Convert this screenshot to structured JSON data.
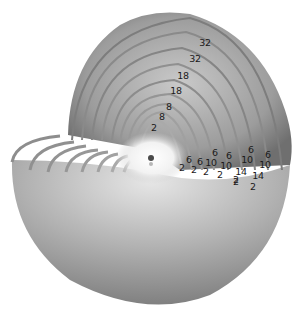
{
  "diagram": {
    "type": "atomic-electron-shell-cutaway",
    "colors": {
      "background": "#ffffff",
      "shell_dark": "#6e6e6e",
      "shell_mid": "#9a9a9a",
      "shell_light": "#d8d8d8",
      "core_glow": "#ffffff",
      "nucleus": "#4a4a4a",
      "label": "#1a1a1a"
    },
    "shell_capacity_labels": [
      {
        "text": "2",
        "x": 154,
        "y": 128
      },
      {
        "text": "8",
        "x": 162,
        "y": 117
      },
      {
        "text": "8",
        "x": 169,
        "y": 107
      },
      {
        "text": "18",
        "x": 176,
        "y": 91
      },
      {
        "text": "18",
        "x": 183,
        "y": 76
      },
      {
        "text": "32",
        "x": 195,
        "y": 59
      },
      {
        "text": "32",
        "x": 205,
        "y": 43
      }
    ],
    "subshell_columns": [
      {
        "labels": [
          {
            "text": "2",
            "x": 182,
            "y": 168
          }
        ]
      },
      {
        "labels": [
          {
            "text": "6",
            "x": 189,
            "y": 160
          },
          {
            "text": "2",
            "x": 194,
            "y": 170
          }
        ]
      },
      {
        "labels": [
          {
            "text": "6",
            "x": 200,
            "y": 162
          },
          {
            "text": "2",
            "x": 206,
            "y": 172
          }
        ]
      },
      {
        "labels": [
          {
            "text": "6",
            "x": 215,
            "y": 153
          },
          {
            "text": "10",
            "x": 211,
            "y": 163
          },
          {
            "text": "2",
            "x": 220,
            "y": 175
          }
        ]
      },
      {
        "labels": [
          {
            "text": "6",
            "x": 229,
            "y": 156
          },
          {
            "text": "10",
            "x": 226,
            "y": 166
          },
          {
            "text": "2",
            "x": 236,
            "y": 180
          }
        ]
      },
      {
        "labels": [
          {
            "text": "6",
            "x": 251,
            "y": 150
          },
          {
            "text": "10",
            "x": 247,
            "y": 160
          },
          {
            "text": "14",
            "x": 241,
            "y": 172
          },
          {
            "text": "2",
            "x": 236,
            "y": 182
          }
        ]
      },
      {
        "labels": [
          {
            "text": "6",
            "x": 268,
            "y": 155
          },
          {
            "text": "10",
            "x": 265,
            "y": 165
          },
          {
            "text": "14",
            "x": 258,
            "y": 176
          },
          {
            "text": "2",
            "x": 253,
            "y": 187
          }
        ]
      }
    ],
    "nucleus": {
      "x": 151,
      "y": 158,
      "r": 3
    }
  }
}
